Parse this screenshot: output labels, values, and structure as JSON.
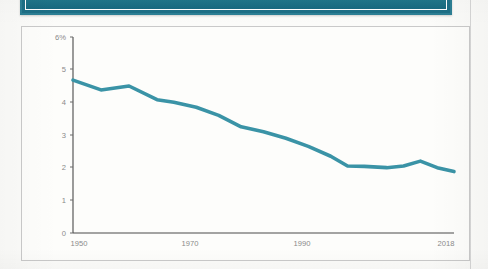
{
  "banner": {
    "title": "",
    "color": "#1d6f86",
    "border_color": "#2c7f94",
    "inner_border_color": "#ffffff"
  },
  "panel": {
    "border_color": "#c9c9c9",
    "background": "#fdfdfb"
  },
  "chart_data": {
    "type": "line",
    "title": "",
    "subtitle": "",
    "xlabel": "",
    "ylabel": "",
    "grid": false,
    "legend": null,
    "line_color": "#3a93a6",
    "axis_color": "#4a4a4a",
    "tick_label_color": "#8a8a8a",
    "xlim": [
      1950,
      2018
    ],
    "ylim": [
      0,
      6
    ],
    "ytick_labels": [
      "6%",
      "5",
      "4",
      "3",
      "2",
      "1",
      "0"
    ],
    "ytick_values": [
      6,
      5,
      4,
      3,
      2,
      1,
      0
    ],
    "xtick_labels": [
      "1950",
      "1970",
      "1990",
      "2018"
    ],
    "xtick_values": [
      1950,
      1970,
      1990,
      2018
    ],
    "x": [
      1950,
      1955,
      1960,
      1965,
      1968,
      1972,
      1976,
      1980,
      1984,
      1988,
      1992,
      1996,
      1999,
      2002,
      2006,
      2009,
      2012,
      2015,
      2018
    ],
    "values": [
      4.68,
      4.38,
      4.5,
      4.08,
      4.0,
      3.85,
      3.6,
      3.25,
      3.1,
      2.9,
      2.65,
      2.35,
      2.05,
      2.04,
      2.0,
      2.05,
      2.2,
      2.0,
      1.88
    ],
    "series": [
      {
        "name": "",
        "color": "#3a93a6",
        "values": [
          4.68,
          4.38,
          4.5,
          4.08,
          4.0,
          3.85,
          3.6,
          3.25,
          3.1,
          2.9,
          2.65,
          2.35,
          2.05,
          2.04,
          2.0,
          2.05,
          2.2,
          2.0,
          1.88
        ]
      }
    ]
  }
}
